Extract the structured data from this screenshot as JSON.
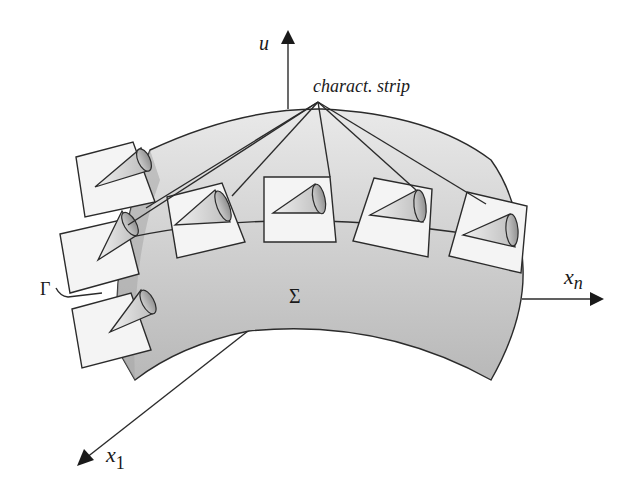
{
  "figure": {
    "type": "3d-geometry-diagram",
    "colors": {
      "surface_fill_light": "#e6e6e6",
      "surface_fill_dark": "#a9a9a9",
      "box_fill": "#f4f4f4",
      "stroke": "#2b2b2b",
      "arrow": "#1a1a1a"
    },
    "axes": {
      "u": {
        "label": "u",
        "tip": [
          288,
          33
        ],
        "base": [
          288,
          109
        ]
      },
      "x_n": {
        "label": "x",
        "subscript": "n",
        "tip": [
          603,
          299
        ],
        "base": [
          522,
          299
        ]
      },
      "x_1": {
        "label": "x",
        "subscript": "1",
        "tip": [
          79,
          464
        ],
        "base": [
          248,
          331
        ]
      }
    },
    "labels": {
      "strip": "charact. strip",
      "surface": "Σ",
      "curve": "Γ"
    },
    "strip_apex": [
      318,
      102
    ],
    "tangent_planes_with_cones": [
      {
        "id": 1,
        "corners": [
          [
            76,
            157
          ],
          [
            133,
            142
          ],
          [
            155,
            202
          ],
          [
            85,
            217
          ]
        ],
        "apex": [
          95,
          187
        ],
        "cone_base": [
          143,
          160
        ]
      },
      {
        "id": 2,
        "corners": [
          [
            60,
            234
          ],
          [
            125,
            219
          ],
          [
            139,
            274
          ],
          [
            70,
            293
          ]
        ],
        "apex": [
          82,
          262
        ],
        "cone_base": [
          129,
          234
        ]
      },
      {
        "id": 3,
        "corners": [
          [
            72,
            309
          ],
          [
            131,
            293
          ],
          [
            151,
            350
          ],
          [
            82,
            368
          ]
        ],
        "apex": [
          91,
          334
        ],
        "cone_base": [
          138,
          305
        ]
      },
      {
        "id": 4,
        "corners": [
          [
            167,
            197
          ],
          [
            222,
            183
          ],
          [
            245,
            242
          ],
          [
            177,
            258
          ]
        ],
        "apex": [
          175,
          225
        ],
        "cone_base": [
          222,
          210
        ]
      },
      {
        "id": 5,
        "corners": [
          [
            264,
            177
          ],
          [
            330,
            177
          ],
          [
            336,
            242
          ],
          [
            264,
            242
          ]
        ],
        "apex": [
          273,
          213
        ],
        "cone_base": [
          322,
          201
        ]
      },
      {
        "id": 6,
        "corners": [
          [
            374,
            178
          ],
          [
            432,
            189
          ],
          [
            428,
            257
          ],
          [
            353,
            241
          ]
        ],
        "apex": [
          370,
          215
        ],
        "cone_base": [
          421,
          210
        ]
      },
      {
        "id": 7,
        "corners": [
          [
            467,
            192
          ],
          [
            527,
            206
          ],
          [
            521,
            273
          ],
          [
            449,
            256
          ]
        ],
        "apex": [
          463,
          235
        ],
        "cone_base": [
          513,
          228
        ]
      }
    ]
  }
}
